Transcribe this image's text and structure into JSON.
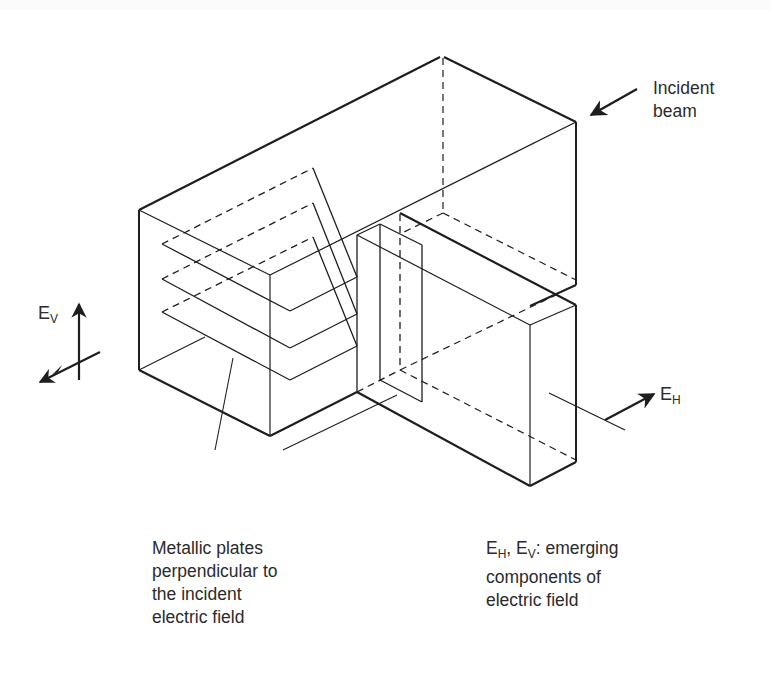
{
  "diagram": {
    "labels": {
      "incident_beam": [
        "Incident",
        "beam"
      ],
      "ev": {
        "main": "E",
        "sub": "V"
      },
      "eh": {
        "main": "E",
        "sub": "H"
      },
      "plates_caption": [
        "Metallic plates",
        "perpendicular to",
        "the incident",
        "electric field"
      ],
      "components_caption": {
        "line1_parts": [
          {
            "main": "E",
            "sub": "H"
          },
          {
            "text": ", "
          },
          {
            "main": "E",
            "sub": "V"
          },
          {
            "text": ": emerging"
          }
        ],
        "line1_text": "EH, EV: emerging",
        "line2": "components of",
        "line3": "electric field"
      }
    },
    "colors": {
      "line": "#1e1e1e",
      "text": "#2b2b2b",
      "background": "#ffffff"
    }
  }
}
